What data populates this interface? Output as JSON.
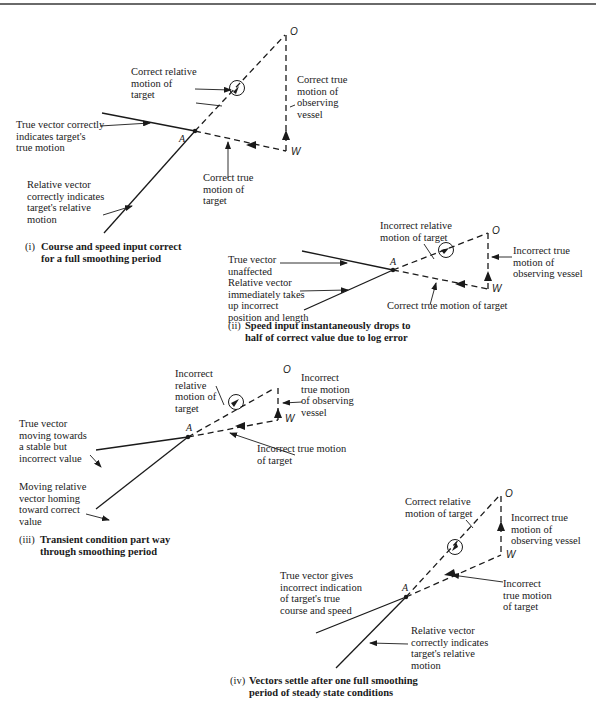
{
  "panels": [
    {
      "id": "i",
      "caption_num": "(i)",
      "caption": "Course and speed input correct\nfor a full smoothing period",
      "points": {
        "O": "O",
        "W": "W",
        "A": "A"
      },
      "labels": {
        "relative_motion": "Correct relative\nmotion of\ntarget",
        "observer_motion": "Correct true\nmotion of\nobserving\nvessel",
        "true_vector": "True vector correctly\nindicates target's\ntrue motion",
        "target_true_motion": "Correct true\nmotion of\ntarget",
        "relative_vector": "Relative vector\ncorrectly indicates\ntarget's relative\nmotion"
      }
    },
    {
      "id": "ii",
      "caption_num": "(ii)",
      "caption": "Speed input instantaneously drops to\nhalf of correct value due to log error",
      "points": {
        "O": "O",
        "W": "W",
        "A": "A"
      },
      "labels": {
        "relative_motion": "Incorrect relative\nmotion of target",
        "observer_motion": "Incorrect true\nmotion of\nobserving vessel",
        "true_vector": "True vector\nunaffected",
        "relative_vector": "Relative vector\nimmediately takes\nup incorrect\nposition and length",
        "target_true_motion": "Correct true motion of target"
      }
    },
    {
      "id": "iii",
      "caption_num": "(iii)",
      "caption": "Transient condition part way\nthrough smoothing period",
      "points": {
        "O": "O",
        "W": "W",
        "A": "A"
      },
      "labels": {
        "relative_motion": "Incorrect\nrelative\nmotion of\ntarget",
        "observer_motion": "Incorrect\ntrue motion\nof observing\nvessel",
        "true_vector": "True vector\nmoving towards\na stable but\nincorrect value",
        "target_true_motion": "Incorrect true motion\nof target",
        "relative_vector": "Moving relative\nvector homing\ntoward correct\nvalue"
      }
    },
    {
      "id": "iv",
      "caption_num": "(iv)",
      "caption": "Vectors settle after one full smoothing\nperiod of steady state conditions",
      "points": {
        "O": "O",
        "W": "W",
        "A": "A"
      },
      "labels": {
        "relative_motion": "Correct relative\nmotion of target",
        "observer_motion": "Incorrect true\nmotion of\nobserving vessel",
        "true_vector": "True vector gives\nincorrect indication\nof target's true\ncourse and speed",
        "target_true_motion": "Incorrect\ntrue motion\nof target",
        "relative_vector": "Relative vector\ncorrectly indicates\ntarget's relative\nmotion"
      }
    }
  ]
}
